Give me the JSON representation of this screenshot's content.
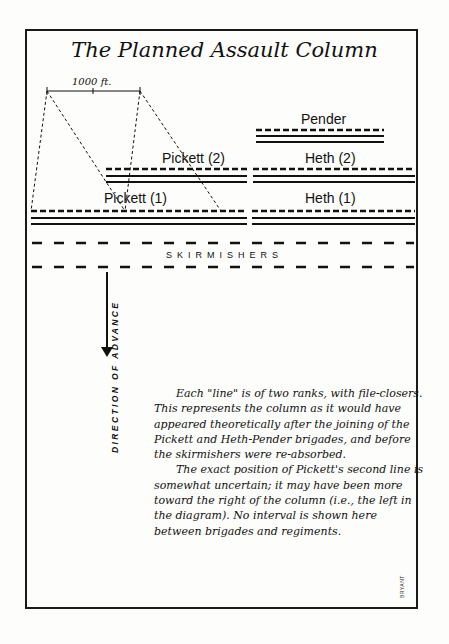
{
  "title": "The Planned Assault Column",
  "scale": {
    "label": "1000 ft."
  },
  "units": [
    {
      "name": "Pender",
      "label": "Pender"
    },
    {
      "name": "Pickett (2)",
      "label": "Pickett (2)"
    },
    {
      "name": "Heth (2)",
      "label": "Heth (2)"
    },
    {
      "name": "Pickett (1)",
      "label": "Pickett (1)"
    },
    {
      "name": "Heth (1)",
      "label": "Heth (1)"
    }
  ],
  "skirmishers_label": "SKIRMISHERS",
  "direction_label": "DIRECTION OF ADVANCE",
  "notes": [
    "Each \"line\" is of two ranks, with file-closers. This represents the column as it would have appeared theoretically after the joining of the Pickett and Heth-Pender brigades, and before the skirmishers were re-absorbed.",
    "The exact position of Pickett's second line is somewhat uncertain; it may have been more toward the right of the column (i.e., the left in the diagram). No interval is shown here between brigades and regiments."
  ],
  "credit": "BRYANT"
}
